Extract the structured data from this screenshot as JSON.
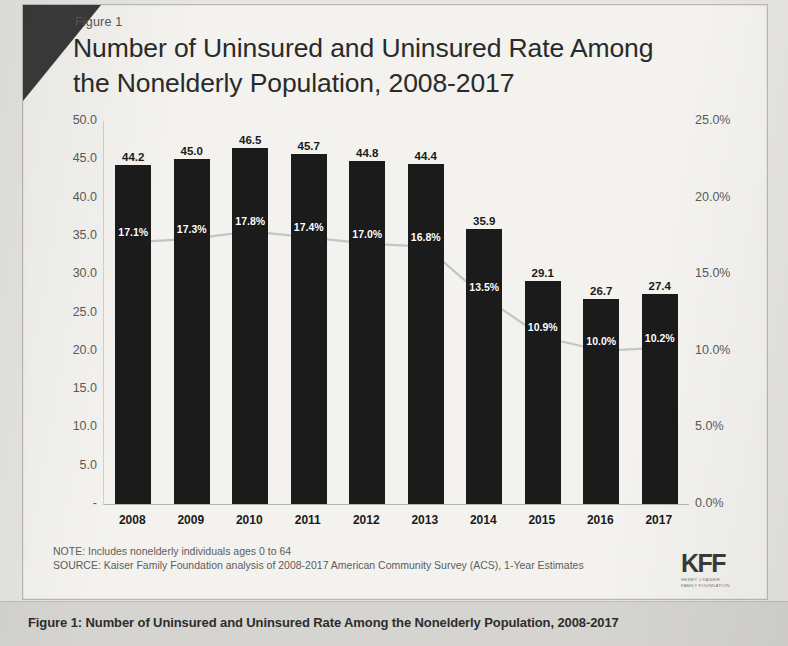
{
  "figure_label": "Figure 1",
  "title_line1": "Number of Uninsured and Uninsured Rate Among",
  "title_line2": "the Nonelderly Population, 2008-2017",
  "notes": {
    "note": "NOTE: Includes nonelderly individuals ages 0 to 64",
    "source": "SOURCE: Kaiser Family Foundation analysis of 2008-2017 American Community Survey (ACS), 1-Year Estimates"
  },
  "logo": {
    "mark": "KFF",
    "sub_line1": "HENRY J KAISER",
    "sub_line2": "FAMILY FOUNDATION"
  },
  "caption": "Figure 1: Number of Uninsured and Uninsured Rate Among the Nonelderly Population, 2008-2017",
  "colors": {
    "bar": "#1b1b1b",
    "line": "#c4c4c4",
    "marker": "#b0b0b0",
    "axis_text": "#5a5a5a",
    "caption_bar": "#d5d4d0"
  },
  "chart_data": {
    "type": "bar",
    "title": "Number of Uninsured and Uninsured Rate Among the Nonelderly Population, 2008-2017",
    "xlabel": "",
    "ylabel": "",
    "categories": [
      "2008",
      "2009",
      "2010",
      "2011",
      "2012",
      "2013",
      "2014",
      "2015",
      "2016",
      "2017"
    ],
    "series": [
      {
        "name": "Number of Uninsured (millions)",
        "type": "bar",
        "axis": "left",
        "values": [
          44.2,
          45.0,
          46.5,
          45.7,
          44.8,
          44.4,
          35.9,
          29.1,
          26.7,
          27.4
        ],
        "labels": [
          "44.2",
          "45.0",
          "46.5",
          "45.7",
          "44.8",
          "44.4",
          "35.9",
          "29.1",
          "26.7",
          "27.4"
        ]
      },
      {
        "name": "Uninsured Rate",
        "type": "line",
        "axis": "right",
        "values": [
          17.1,
          17.3,
          17.8,
          17.4,
          17.0,
          16.8,
          13.5,
          10.9,
          10.0,
          10.2
        ],
        "labels": [
          "17.1%",
          "17.3%",
          "17.8%",
          "17.4%",
          "17.0%",
          "16.8%",
          "13.5%",
          "10.9%",
          "10.0%",
          "10.2%"
        ]
      }
    ],
    "ylim": [
      0,
      50
    ],
    "y2lim": [
      0,
      25
    ],
    "yticks": [
      "50.0",
      "45.0",
      "40.0",
      "35.0",
      "30.0",
      "25.0",
      "20.0",
      "15.0",
      "10.0",
      "5.0",
      "-"
    ],
    "ytick_values": [
      50,
      45,
      40,
      35,
      30,
      25,
      20,
      15,
      10,
      5,
      0
    ],
    "y2ticks": [
      "25.0%",
      "20.0%",
      "15.0%",
      "10.0%",
      "5.0%",
      "0.0%"
    ],
    "y2tick_values": [
      25,
      20,
      15,
      10,
      5,
      0
    ],
    "grid": false,
    "legend": "none"
  }
}
